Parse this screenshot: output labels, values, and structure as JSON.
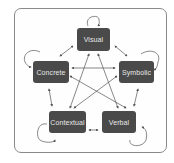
{
  "diagram": {
    "nodes": [
      {
        "id": "visual",
        "label": "Visual"
      },
      {
        "id": "concrete",
        "label": "Concrete"
      },
      {
        "id": "symbolic",
        "label": "Symbolic"
      },
      {
        "id": "contextual",
        "label": "Contextual"
      },
      {
        "id": "verbal",
        "label": "Verbal"
      }
    ],
    "edges": [
      {
        "from": "visual",
        "to": "concrete",
        "bidirectional": true
      },
      {
        "from": "visual",
        "to": "symbolic",
        "bidirectional": true
      },
      {
        "from": "visual",
        "to": "contextual",
        "bidirectional": true
      },
      {
        "from": "visual",
        "to": "verbal",
        "bidirectional": true
      },
      {
        "from": "concrete",
        "to": "symbolic",
        "bidirectional": true
      },
      {
        "from": "concrete",
        "to": "contextual",
        "bidirectional": true
      },
      {
        "from": "concrete",
        "to": "verbal",
        "bidirectional": true
      },
      {
        "from": "symbolic",
        "to": "contextual",
        "bidirectional": true
      },
      {
        "from": "symbolic",
        "to": "verbal",
        "bidirectional": true
      },
      {
        "from": "contextual",
        "to": "verbal",
        "bidirectional": true
      }
    ],
    "self_loops": [
      "visual",
      "concrete",
      "symbolic",
      "contextual",
      "verbal"
    ],
    "colors": {
      "node_fill": "#4a4a4a",
      "node_text": "#e8e8e8",
      "edge": "#555555",
      "frame": "#8a8a8a"
    }
  }
}
